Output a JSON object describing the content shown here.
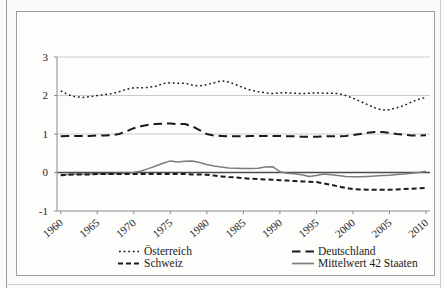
{
  "figure": {
    "frame_border_color": "#9d9d9d",
    "page_background": "#fafaf8"
  },
  "chart_data": {
    "type": "line",
    "title": "",
    "xlabel": "",
    "ylabel": "",
    "ylim": [
      -1,
      3
    ],
    "y_ticks": [
      3,
      2,
      1,
      0,
      -1
    ],
    "y_tick_labels": [
      "3",
      "2",
      "1",
      "0",
      "-1"
    ],
    "x_tick_years": [
      1960,
      1965,
      1970,
      1975,
      1980,
      1985,
      1990,
      1995,
      2000,
      2005,
      2010
    ],
    "x_tick_labels": [
      "1960",
      "1965",
      "1970",
      "1975",
      "1980",
      "1985",
      "1990",
      "1995",
      "2000",
      "2005",
      "2010"
    ],
    "x_years": [
      1960,
      1961,
      1962,
      1963,
      1964,
      1965,
      1966,
      1967,
      1968,
      1969,
      1970,
      1971,
      1972,
      1973,
      1974,
      1975,
      1976,
      1977,
      1978,
      1979,
      1980,
      1981,
      1982,
      1983,
      1984,
      1985,
      1986,
      1987,
      1988,
      1989,
      1990,
      1991,
      1992,
      1993,
      1994,
      1995,
      1996,
      1997,
      1998,
      1999,
      2000,
      2001,
      2002,
      2003,
      2004,
      2005,
      2006,
      2007,
      2008,
      2009,
      2010
    ],
    "grid": "horizontal gridlines at 1,2,3 light gray; dark emphasized line at 0; axis line at -1",
    "legend_position": "bottom, two columns two rows",
    "colors": {
      "gridline": "#cbcbcb",
      "axis": "#8a8a8a",
      "zero_line": "#4c4c4c",
      "text": "#1c1c1c",
      "series_black": "#1a1a1a",
      "series_gray": "#7d7d7d"
    },
    "series": [
      {
        "name": "Österreich",
        "key": "oesterreich",
        "style": "dotted",
        "color": "#1a1a1a",
        "values": [
          2.12,
          2.02,
          1.97,
          1.95,
          1.97,
          2.0,
          2.02,
          2.05,
          2.1,
          2.16,
          2.2,
          2.2,
          2.21,
          2.24,
          2.31,
          2.33,
          2.32,
          2.32,
          2.27,
          2.25,
          2.28,
          2.33,
          2.38,
          2.35,
          2.28,
          2.2,
          2.14,
          2.1,
          2.07,
          2.05,
          2.07,
          2.07,
          2.06,
          2.05,
          2.06,
          2.07,
          2.06,
          2.06,
          2.05,
          2.0,
          1.93,
          1.85,
          1.76,
          1.68,
          1.62,
          1.63,
          1.68,
          1.74,
          1.83,
          1.9,
          1.95
        ]
      },
      {
        "name": "Deutschland",
        "key": "deutschland",
        "style": "long-dash",
        "color": "#1a1a1a",
        "values": [
          0.94,
          0.95,
          0.95,
          0.95,
          0.95,
          0.96,
          0.96,
          0.97,
          1.0,
          1.07,
          1.15,
          1.2,
          1.24,
          1.26,
          1.27,
          1.27,
          1.26,
          1.26,
          1.2,
          1.1,
          1.0,
          0.96,
          0.95,
          0.94,
          0.94,
          0.94,
          0.95,
          0.95,
          0.95,
          0.95,
          0.95,
          0.94,
          0.94,
          0.93,
          0.93,
          0.93,
          0.94,
          0.94,
          0.94,
          0.95,
          0.97,
          1.0,
          1.03,
          1.05,
          1.05,
          1.03,
          1.0,
          0.98,
          0.96,
          0.96,
          0.97
        ]
      },
      {
        "name": "Schweiz",
        "key": "schweiz",
        "style": "dash",
        "color": "#1a1a1a",
        "values": [
          -0.07,
          -0.06,
          -0.05,
          -0.05,
          -0.05,
          -0.04,
          -0.04,
          -0.04,
          -0.04,
          -0.04,
          -0.04,
          -0.04,
          -0.04,
          -0.04,
          -0.04,
          -0.04,
          -0.04,
          -0.04,
          -0.05,
          -0.05,
          -0.06,
          -0.08,
          -0.1,
          -0.12,
          -0.13,
          -0.15,
          -0.16,
          -0.17,
          -0.18,
          -0.19,
          -0.2,
          -0.21,
          -0.22,
          -0.23,
          -0.24,
          -0.25,
          -0.28,
          -0.32,
          -0.36,
          -0.4,
          -0.43,
          -0.44,
          -0.45,
          -0.45,
          -0.45,
          -0.45,
          -0.44,
          -0.43,
          -0.42,
          -0.41,
          -0.4
        ]
      },
      {
        "name": "Mittelwert 42 Staaten",
        "key": "mittelwert-42-staaten",
        "style": "solid",
        "color": "#7d7d7d",
        "values": [
          -0.05,
          -0.05,
          -0.04,
          -0.04,
          -0.04,
          -0.03,
          -0.03,
          -0.03,
          -0.02,
          -0.02,
          0.0,
          0.04,
          0.1,
          0.17,
          0.24,
          0.3,
          0.27,
          0.29,
          0.3,
          0.26,
          0.21,
          0.17,
          0.14,
          0.12,
          0.11,
          0.1,
          0.1,
          0.11,
          0.14,
          0.15,
          0.02,
          -0.02,
          -0.03,
          -0.06,
          -0.1,
          -0.08,
          -0.04,
          -0.06,
          -0.08,
          -0.1,
          -0.11,
          -0.11,
          -0.1,
          -0.09,
          -0.08,
          -0.07,
          -0.05,
          -0.04,
          -0.02,
          0.0,
          0.03
        ]
      }
    ]
  }
}
